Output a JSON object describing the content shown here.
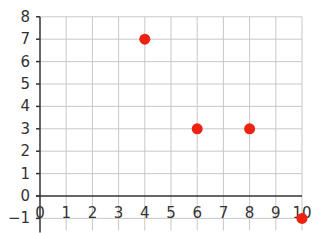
{
  "chart_data": {
    "type": "scatter",
    "title": "",
    "xlabel": "",
    "ylabel": "",
    "x_ticks": [
      "0",
      "1",
      "2",
      "3",
      "4",
      "5",
      "6",
      "7",
      "8",
      "9",
      "10"
    ],
    "y_ticks": [
      "-1",
      "0",
      "1",
      "2",
      "3",
      "4",
      "5",
      "6",
      "7",
      "8"
    ],
    "xlim": [
      0,
      10
    ],
    "ylim": [
      -1,
      8
    ],
    "grid": true,
    "points": [
      {
        "x": 4,
        "y": 7
      },
      {
        "x": 6,
        "y": 3
      },
      {
        "x": 8,
        "y": 3
      },
      {
        "x": 10,
        "y": -1
      }
    ],
    "point_color": "#ee2211",
    "grid_color": "#c8c8c8",
    "axis_color": "#333333"
  }
}
